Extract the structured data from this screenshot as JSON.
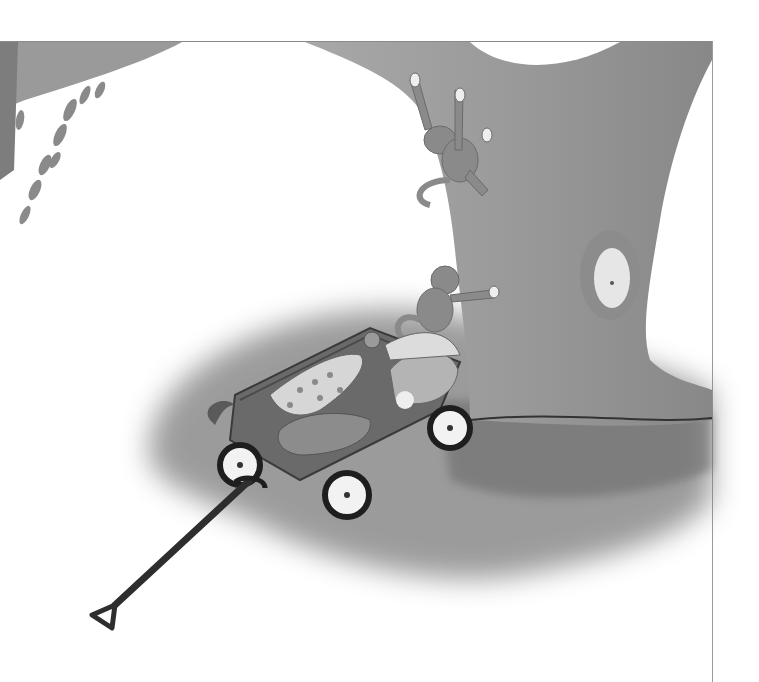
{
  "illustration": {
    "style": "grayscale watercolor picture-book illustration",
    "palette": {
      "background": "#ffffff",
      "frame_line": "#8a8a8a",
      "trunk": "#9c9c9c",
      "trunk_dark": "#7a7a7a",
      "ground_shadow": "#6e6e6e",
      "wagon_body": "#6a6a6a",
      "wheel_rim": "#222222",
      "wheel_face": "#f2f2f2",
      "handle": "#2e2e2e",
      "monkey": "#8c8c8c"
    },
    "elements": [
      "branch-top-left",
      "leaf-clusters-left",
      "tree-trunk",
      "knot-hole",
      "monkey-climbing-upper",
      "monkey-climbing-lower",
      "ground-shadow",
      "wagon",
      "stuffed-animals",
      "wagon-wheels",
      "wagon-handle"
    ]
  }
}
